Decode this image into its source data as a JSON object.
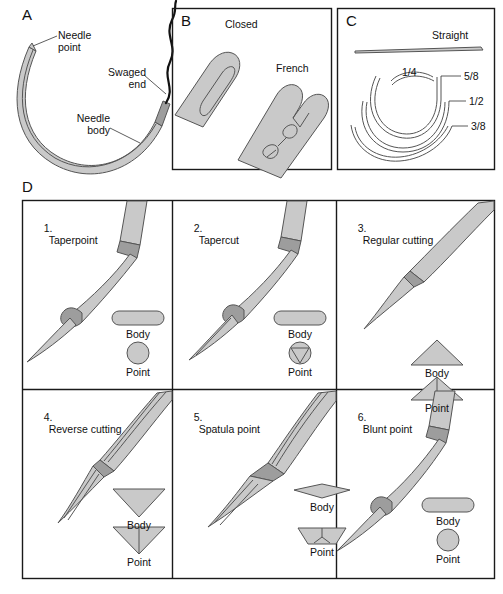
{
  "figure": {
    "background_color": "#ffffff",
    "fill_color": "#c9c9c9",
    "fill_color_dark": "#9d9d9d",
    "outline_color": "#555555",
    "border_color": "#1a1a1a",
    "thread_color": "#111111"
  },
  "panels": {
    "a": {
      "letter": "A",
      "labels": [
        {
          "id": "needle-point",
          "text": "Needle\npoint"
        },
        {
          "id": "swaged-end",
          "text": "Swaged\nend"
        },
        {
          "id": "needle-body",
          "text": "Needle\nbody"
        }
      ]
    },
    "b": {
      "letter": "B",
      "labels": [
        {
          "id": "closed-eye",
          "text": "Closed"
        },
        {
          "id": "french-eye",
          "text": "French"
        }
      ]
    },
    "c": {
      "letter": "C",
      "labels": [
        {
          "id": "straight",
          "text": "Straight"
        },
        {
          "id": "quarter-circle",
          "text": "1/4"
        },
        {
          "id": "five-eighths-circle",
          "text": "5/8"
        },
        {
          "id": "half-circle",
          "text": "1/2"
        },
        {
          "id": "three-eighths-circle",
          "text": "3/8"
        }
      ]
    },
    "d": {
      "letter": "D",
      "cells": [
        {
          "number": "1.",
          "name": "Taperpoint",
          "body_caption": "Body",
          "point_caption": "Point",
          "body_shape": "rounded-rect",
          "point_shape": "circle"
        },
        {
          "number": "2.",
          "name": "Tapercut",
          "body_caption": "Body",
          "point_caption": "Point",
          "body_shape": "rounded-rect",
          "point_shape": "circle-triangle"
        },
        {
          "number": "3.",
          "name": "Regular cutting",
          "body_caption": "Body",
          "point_caption": "Point",
          "body_shape": "triangle-up",
          "point_shape": "triangle-up-line"
        },
        {
          "number": "4.",
          "name": "Reverse cutting",
          "body_caption": "Body",
          "point_caption": "Point",
          "body_shape": "triangle-down",
          "point_shape": "triangle-down-line"
        },
        {
          "number": "5.",
          "name": "Spatula point",
          "body_caption": "Body",
          "point_caption": "Point",
          "body_shape": "hexagon",
          "point_shape": "trapezoid"
        },
        {
          "number": "6.",
          "name": "Blunt point",
          "body_caption": "Body",
          "point_caption": "Point",
          "body_shape": "rounded-rect",
          "point_shape": "circle"
        }
      ]
    }
  }
}
